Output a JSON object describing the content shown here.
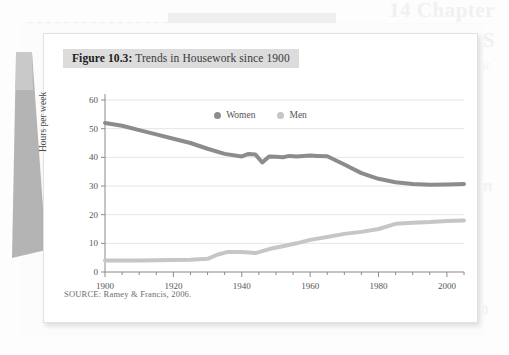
{
  "background": {
    "ghost_heading_1": "14 Chapter",
    "ghost_heading_2": "THE FORMS",
    "ghost_text_1": "a lower body or",
    "ghost_text_2": "more than",
    "ghost_text_3": "1900"
  },
  "figure": {
    "number_label": "Figure 10.3:",
    "title": " Trends in Housework since 1900",
    "source": "SOURCE: Ramey & Francis, 2006.",
    "y_axis_title": "Hours per week"
  },
  "legend": {
    "position": "top-center",
    "items": [
      {
        "label": "Women",
        "color": "#8c8c8c"
      },
      {
        "label": "Men",
        "color": "#c6c6c6"
      }
    ]
  },
  "colors": {
    "women_line": "#8c8c8c",
    "men_line": "#c6c6c6",
    "gridline": "#e6e6e6",
    "axis": "#8a8a8a",
    "title_band": "#dcdcdc",
    "card": "#ffffff",
    "page": "#fcfcfc"
  },
  "chart_data": {
    "type": "line",
    "title": "Trends in Housework since 1900",
    "xlabel": "",
    "ylabel": "Hours per week",
    "xlim": [
      1900,
      2005
    ],
    "ylim": [
      0,
      60
    ],
    "ytick_values": [
      0,
      10,
      20,
      30,
      40,
      50,
      60
    ],
    "ytick_labels": [
      "0",
      "10",
      "20",
      "30",
      "40",
      "50",
      "60"
    ],
    "xtick_values": [
      1900,
      1920,
      1940,
      1960,
      1980,
      2000
    ],
    "xtick_labels": [
      "1900",
      "1920",
      "1940",
      "1960",
      "1980",
      "2000"
    ],
    "minor_xticks_every": 5,
    "grid": "horizontal",
    "legend_position": "top-center",
    "series": [
      {
        "name": "Women",
        "color": "#8c8c8c",
        "x": [
          1900,
          1905,
          1910,
          1915,
          1920,
          1925,
          1930,
          1935,
          1940,
          1942,
          1944,
          1946,
          1948,
          1950,
          1952,
          1954,
          1956,
          1958,
          1960,
          1962,
          1965,
          1970,
          1975,
          1980,
          1985,
          1990,
          1995,
          2000,
          2005
        ],
        "values": [
          52.0,
          51.0,
          49.5,
          48.0,
          46.5,
          45.0,
          43.0,
          41.2,
          40.3,
          41.2,
          41.0,
          38.2,
          40.3,
          40.2,
          40.0,
          40.5,
          40.3,
          40.5,
          40.6,
          40.5,
          40.4,
          37.5,
          34.5,
          32.5,
          31.3,
          30.7,
          30.4,
          30.5,
          30.7
        ]
      },
      {
        "name": "Men",
        "color": "#c6c6c6",
        "x": [
          1900,
          1905,
          1910,
          1915,
          1920,
          1925,
          1930,
          1933,
          1936,
          1940,
          1944,
          1948,
          1952,
          1956,
          1960,
          1965,
          1970,
          1975,
          1980,
          1985,
          1990,
          1995,
          2000,
          2005
        ],
        "values": [
          4.0,
          4.0,
          4.0,
          4.1,
          4.2,
          4.3,
          4.6,
          6.1,
          7.0,
          7.0,
          6.6,
          8.0,
          9.0,
          10.0,
          11.2,
          12.2,
          13.3,
          14.0,
          15.0,
          16.8,
          17.2,
          17.4,
          17.8,
          18.0
        ]
      }
    ]
  }
}
